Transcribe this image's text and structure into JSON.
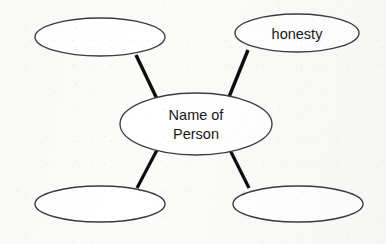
{
  "diagram": {
    "type": "concept-map",
    "background_color": "#fbfbf9",
    "node_fill_color": "#ffffff",
    "node_stroke_color": "#3c3c3e",
    "connector_color": "#0d0d0d",
    "text_color": "#17181a",
    "nodes": [
      {
        "id": "center",
        "role": "center",
        "label": "Name of Person",
        "label_lines": [
          "Name of",
          "Person"
        ],
        "cx": 196,
        "cy": 124,
        "rx": 76,
        "ry": 31,
        "stroke_width": 1.3,
        "filled_text": true
      },
      {
        "id": "top-left",
        "role": "trait",
        "label": "",
        "label_lines": [],
        "cx": 100,
        "cy": 37,
        "rx": 65,
        "ry": 19,
        "stroke_width": 1.4,
        "filled_text": false
      },
      {
        "id": "top-right",
        "role": "trait",
        "label": "honesty",
        "label_lines": [
          "honesty"
        ],
        "cx": 297,
        "cy": 33,
        "rx": 62,
        "ry": 19,
        "stroke_width": 1.4,
        "filled_text": true
      },
      {
        "id": "bottom-left",
        "role": "trait",
        "label": "",
        "label_lines": [],
        "cx": 100,
        "cy": 204,
        "rx": 65,
        "ry": 18,
        "stroke_width": 1.4,
        "filled_text": false
      },
      {
        "id": "bottom-right",
        "role": "trait",
        "label": "",
        "label_lines": [],
        "cx": 298,
        "cy": 204,
        "rx": 65,
        "ry": 18,
        "stroke_width": 1.4,
        "filled_text": false
      }
    ],
    "connectors": [
      {
        "id": "center-to-top-left",
        "from": "center",
        "to": "top-left",
        "x1": 136,
        "y1": 55,
        "x2": 157,
        "y2": 99,
        "width": 3.4
      },
      {
        "id": "center-to-top-right",
        "from": "center",
        "to": "top-right",
        "x1": 248,
        "y1": 50,
        "x2": 229,
        "y2": 97,
        "width": 3.4
      },
      {
        "id": "center-to-bottom-left",
        "from": "center",
        "to": "bottom-left",
        "x1": 157,
        "y1": 150,
        "x2": 137,
        "y2": 188,
        "width": 3.2
      },
      {
        "id": "center-to-bottom-right",
        "from": "center",
        "to": "bottom-right",
        "x1": 230,
        "y1": 150,
        "x2": 249,
        "y2": 188,
        "width": 3.2
      }
    ]
  }
}
